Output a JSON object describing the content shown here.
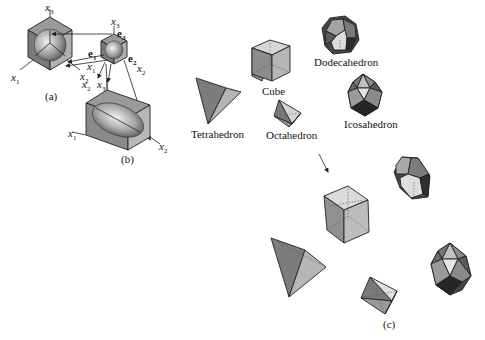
{
  "figure": {
    "panels": {
      "a": "(a)",
      "b": "(b)",
      "c": "(c)"
    },
    "axes": {
      "x1": "x",
      "x2": "x",
      "x3": "x",
      "sub1": "1",
      "sub2": "2",
      "sub3": "3"
    },
    "basis": {
      "e": "e",
      "sub1": "1",
      "sub2": "2",
      "sub3": "3"
    },
    "solids": {
      "tetrahedron": "Tetrahedron",
      "cube": "Cube",
      "octahedron": "Octahedron",
      "dodecahedron": "Dodecahedron",
      "icosahedron": "Icosahedron"
    },
    "colors": {
      "light_face": "#d8d8d8",
      "mid_face": "#a8a8a8",
      "dark_face": "#6e6e6e",
      "darkest_face": "#3a3a3a",
      "ink": "#222222"
    }
  }
}
